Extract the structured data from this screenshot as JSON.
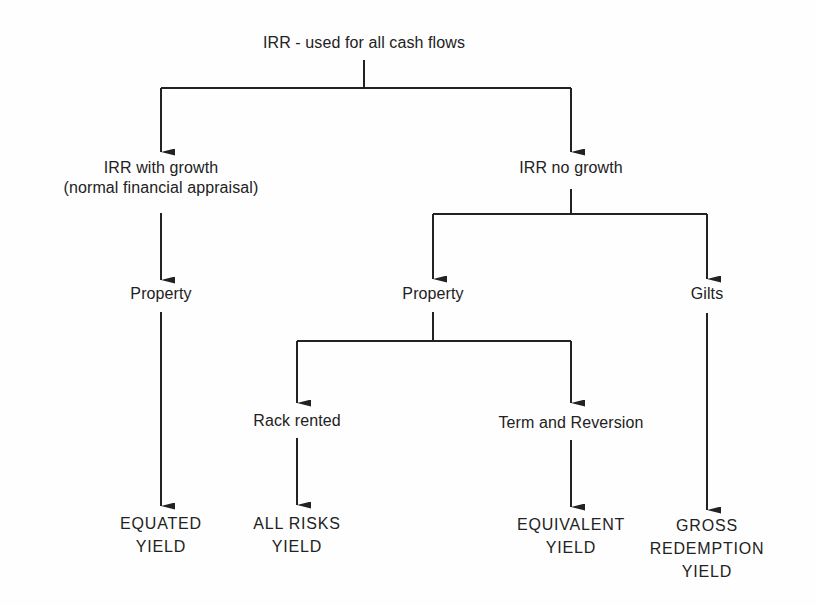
{
  "diagram": {
    "type": "hierarchy",
    "line_color": "#222222",
    "root": {
      "label": "IRR - used for all cash flows"
    },
    "level1": {
      "with_growth": {
        "line1": "IRR with growth",
        "line2": "(normal financial appraisal)"
      },
      "no_growth": {
        "label": "IRR no growth"
      }
    },
    "level2": {
      "growth_property": {
        "label": "Property"
      },
      "nogrowth_property": {
        "label": "Property"
      },
      "gilts": {
        "label": "Gilts"
      }
    },
    "level3": {
      "rack_rented": {
        "label": "Rack rented"
      },
      "term_reversion": {
        "label": "Term and Reversion"
      }
    },
    "leaves": {
      "equated_yield": {
        "line1": "EQUATED",
        "line2": "YIELD"
      },
      "all_risks_yield": {
        "line1": "ALL RISKS",
        "line2": "YIELD"
      },
      "equivalent_yield": {
        "line1": "EQUIVALENT",
        "line2": "YIELD"
      },
      "gross_redemption_yield": {
        "line1": "GROSS",
        "line2": "REDEMPTION",
        "line3": "YIELD"
      }
    },
    "edges": [
      [
        "IRR - used for all cash flows",
        "IRR with growth (normal financial appraisal)"
      ],
      [
        "IRR - used for all cash flows",
        "IRR no growth"
      ],
      [
        "IRR with growth (normal financial appraisal)",
        "Property"
      ],
      [
        "Property",
        "EQUATED YIELD"
      ],
      [
        "IRR no growth",
        "Property"
      ],
      [
        "IRR no growth",
        "Gilts"
      ],
      [
        "Property",
        "Rack rented"
      ],
      [
        "Property",
        "Term and Reversion"
      ],
      [
        "Rack rented",
        "ALL RISKS YIELD"
      ],
      [
        "Term and Reversion",
        "EQUIVALENT YIELD"
      ],
      [
        "Gilts",
        "GROSS REDEMPTION YIELD"
      ]
    ]
  }
}
